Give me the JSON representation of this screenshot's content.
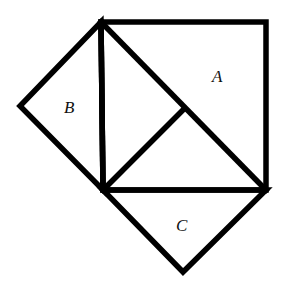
{
  "diagram": {
    "stroke_color": "#000000",
    "background": "#ffffff",
    "vertices": {
      "top_left": [
        101,
        22
      ],
      "top_right": [
        266,
        22
      ],
      "bottom_right": [
        266,
        190
      ],
      "bottom_left": [
        103,
        190
      ],
      "left_point": [
        20,
        106
      ],
      "inner_point": [
        183,
        110
      ],
      "bottom_point": [
        183,
        272
      ]
    },
    "labels": {
      "A": {
        "text": "A",
        "x": 212,
        "y": 82
      },
      "B": {
        "text": "B",
        "x": 64,
        "y": 113
      },
      "C": {
        "text": "C",
        "x": 176,
        "y": 231
      }
    }
  }
}
